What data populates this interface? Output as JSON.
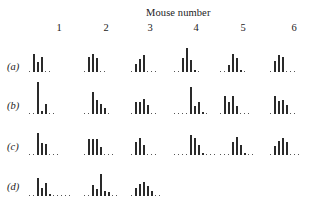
{
  "figure": {
    "title": "Mouse number",
    "columns": [
      "1",
      "2",
      "3",
      "4",
      "5",
      "6"
    ],
    "rows": [
      "(a)",
      "(b)",
      "(c)",
      "(d)"
    ]
  },
  "chart_data": {
    "type": "bar",
    "title": "Mouse number",
    "xlabel": "",
    "ylabel": "",
    "grid": false,
    "columns": [
      "1",
      "2",
      "3",
      "4",
      "5",
      "6"
    ],
    "rows": [
      {
        "label": "(a)",
        "histograms": [
          [
            0,
            18,
            10,
            15,
            0,
            0
          ],
          [
            0,
            15,
            18,
            14,
            0,
            0
          ],
          [
            0,
            8,
            13,
            17,
            0,
            0,
            0
          ],
          [
            0,
            0,
            14,
            24,
            12,
            2,
            0
          ],
          [
            0,
            0,
            7,
            18,
            14,
            2,
            0
          ],
          [
            0,
            11,
            17,
            15,
            0,
            0,
            0
          ]
        ]
      },
      {
        "label": "(b)",
        "histograms": [
          [
            0,
            0,
            32,
            3,
            10,
            0,
            0
          ],
          [
            0,
            0,
            22,
            14,
            10,
            6,
            0
          ],
          [
            0,
            12,
            12,
            15,
            9,
            0,
            0
          ],
          [
            0,
            0,
            0,
            0,
            27,
            8,
            12,
            2,
            0
          ],
          [
            0,
            18,
            12,
            18,
            8,
            0,
            0,
            0
          ],
          [
            0,
            18,
            13,
            14,
            9,
            0,
            0
          ]
        ]
      },
      {
        "label": "(c)",
        "histograms": [
          [
            0,
            0,
            22,
            12,
            11,
            0,
            0,
            0
          ],
          [
            0,
            16,
            16,
            16,
            8,
            0,
            0,
            0
          ],
          [
            0,
            13,
            17,
            10,
            0,
            0,
            0
          ],
          [
            0,
            0,
            0,
            0,
            20,
            17,
            10,
            2,
            0,
            0,
            0
          ],
          [
            0,
            0,
            0,
            13,
            18,
            10,
            2,
            0,
            0
          ],
          [
            0,
            9,
            14,
            17,
            13,
            0,
            0,
            0
          ]
        ]
      },
      {
        "label": "(d)",
        "histograms": [
          [
            0,
            0,
            18,
            8,
            13,
            2,
            0,
            0,
            0,
            0,
            0
          ],
          [
            0,
            0,
            11,
            7,
            22,
            5,
            4,
            0,
            0
          ],
          [
            0,
            8,
            12,
            14,
            10,
            5,
            0,
            0
          ]
        ]
      }
    ]
  }
}
